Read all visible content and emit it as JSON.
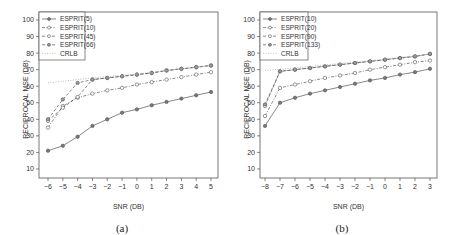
{
  "chart_data": [
    {
      "type": "line",
      "panel": "a",
      "caption": "(a)",
      "title": "",
      "xlabel": "SNR (DB)",
      "ylabel": "RECIPROCAL MSE (DB)",
      "x": [
        -6,
        -5,
        -4,
        -3,
        -2,
        -1,
        0,
        1,
        2,
        3,
        4,
        5
      ],
      "xticks": [
        "−6",
        "−5",
        "−4",
        "−3",
        "−2",
        "−1",
        "0",
        "1",
        "2",
        "3",
        "4",
        "5"
      ],
      "yticks": [
        10,
        20,
        30,
        40,
        50,
        60,
        70,
        80,
        90,
        100
      ],
      "ylim": [
        5,
        102
      ],
      "xlim": [
        -6.4,
        5.4
      ],
      "grid": false,
      "legend_position": "upper left",
      "series": [
        {
          "name": "ESPRIT(5)",
          "style": "solid",
          "marker": "filled-circle",
          "values": [
            21,
            24,
            29.5,
            36,
            40,
            44,
            46,
            48.5,
            50.5,
            52.5,
            54.5,
            56.5
          ]
        },
        {
          "name": "ESPRIT(10)",
          "style": "dashdot",
          "marker": "open-circle",
          "values": [
            35,
            48,
            53,
            55.5,
            57.5,
            59,
            61,
            62.5,
            64,
            65.5,
            67,
            68.5
          ]
        },
        {
          "name": "ESPRIT(45)",
          "style": "dashed",
          "marker": "open-circle",
          "values": [
            39,
            47,
            53.5,
            64,
            65,
            66,
            67,
            68,
            69.5,
            70.5,
            71.5,
            72.5
          ]
        },
        {
          "name": "ESPRIT(66)",
          "style": "dashed",
          "marker": "dotted-circle",
          "values": [
            40,
            52,
            62,
            64,
            65,
            66,
            67,
            68,
            69.5,
            70.5,
            71.5,
            72.5
          ]
        },
        {
          "name": "CRLB",
          "style": "dotted",
          "marker": "none",
          "values": [
            62,
            63,
            64,
            65,
            65.8,
            66.6,
            67.4,
            68.3,
            69.3,
            70.3,
            71.4,
            72.5
          ]
        }
      ]
    },
    {
      "type": "line",
      "panel": "b",
      "caption": "(b)",
      "title": "",
      "xlabel": "SNR (DB)",
      "ylabel": "RECIPROCAL MSE (DB)",
      "x": [
        -8,
        -7,
        -6,
        -5,
        -4,
        -3,
        -2,
        -1,
        0,
        1,
        2,
        3
      ],
      "xticks": [
        "−8",
        "−7",
        "−6",
        "−5",
        "−4",
        "−3",
        "−2",
        "−1",
        "0",
        "1",
        "2",
        "3"
      ],
      "yticks": [
        10,
        20,
        30,
        40,
        50,
        60,
        70,
        80,
        90,
        100
      ],
      "ylim": [
        5,
        102
      ],
      "xlim": [
        -8.4,
        3.4
      ],
      "grid": false,
      "legend_position": "upper left",
      "series": [
        {
          "name": "ESPRIT(10)",
          "style": "solid",
          "marker": "filled-circle",
          "values": [
            36,
            50,
            53,
            55.5,
            57.5,
            59.5,
            61.5,
            63.5,
            65,
            67,
            68.5,
            70.5
          ]
        },
        {
          "name": "ESPRIT(20)",
          "style": "dashdot",
          "marker": "open-circle",
          "values": [
            42,
            59,
            61,
            63,
            65,
            66.5,
            68,
            70,
            71.5,
            73,
            74.5,
            75.5
          ]
        },
        {
          "name": "ESPRIT(90)",
          "style": "dashed",
          "marker": "open-circle",
          "values": [
            48,
            69,
            70,
            71,
            72,
            73,
            74,
            75,
            76,
            77,
            78,
            79.5
          ]
        },
        {
          "name": "ESPRIT(133)",
          "style": "dashed",
          "marker": "dotted-circle",
          "values": [
            49,
            69,
            70,
            71,
            72,
            73,
            74,
            75,
            76,
            77,
            78,
            79.5
          ]
        },
        {
          "name": "CRLB",
          "style": "dotted",
          "marker": "none",
          "values": [
            69.5,
            70.3,
            71.1,
            72,
            72.8,
            73.7,
            74.6,
            75.5,
            76.4,
            77.4,
            78.4,
            79.5
          ]
        }
      ]
    }
  ],
  "panels": [
    {
      "caption": "(a)",
      "xlabel": "SNR (DB)",
      "ylabel": "RECIPROCAL MSE (DB)",
      "legend": [
        "ESPRIT(5)",
        "ESPRIT(10)",
        "ESPRIT(45)",
        "ESPRIT(66)",
        "CRLB"
      ]
    },
    {
      "caption": "(b)",
      "xlabel": "SNR (DB)",
      "ylabel": "RECIPROCAL MSE (DB)",
      "legend": [
        "ESPRIT(10)",
        "ESPRIT(20)",
        "ESPRIT(90)",
        "ESPRIT(133)",
        "CRLB"
      ]
    }
  ],
  "colors": {
    "axis": "#555555",
    "line": "#555555",
    "crlb": "#aaaaaa",
    "background": "#ffffff"
  }
}
